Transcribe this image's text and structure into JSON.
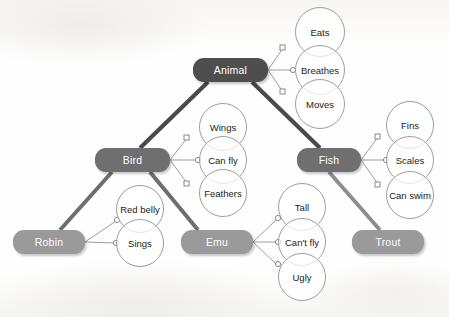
{
  "diagram": {
    "colors": {
      "tier1": "#4e4e4e",
      "tier2": "#6f6f6f",
      "tier3": "#9a9a9a",
      "thick_edge_dark": "#4a4a4a",
      "thick_edge_mid": "#6e6e6e",
      "thick_edge_light": "#8d8d8d",
      "thin_edge": "#9d9d9d",
      "circle_stroke": "#9d9d9d",
      "node_text": "#ffffff",
      "circle_text": "#1b1b1b",
      "background": "#fdfdfc"
    },
    "nodes": [
      {
        "id": "animal",
        "label": "Animal",
        "tier": 1,
        "x": 193,
        "y": 58,
        "w": 75,
        "h": 24
      },
      {
        "id": "bird",
        "label": "Bird",
        "tier": 2,
        "x": 95,
        "y": 148,
        "w": 75,
        "h": 24
      },
      {
        "id": "fish",
        "label": "Fish",
        "tier": 2,
        "x": 297,
        "y": 148,
        "w": 64,
        "h": 24
      },
      {
        "id": "robin",
        "label": "Robin",
        "tier": 3,
        "x": 13,
        "y": 230,
        "w": 72,
        "h": 24
      },
      {
        "id": "emu",
        "label": "Emu",
        "tier": 3,
        "x": 181,
        "y": 230,
        "w": 72,
        "h": 24
      },
      {
        "id": "trout",
        "label": "Trout",
        "tier": 3,
        "x": 352,
        "y": 230,
        "w": 72,
        "h": 24
      }
    ],
    "attributes": [
      {
        "id": "eats",
        "label": "Eats",
        "owner": "animal",
        "cx": 320,
        "cy": 32,
        "r": 25
      },
      {
        "id": "breathes",
        "label": "Breathes",
        "owner": "animal",
        "cx": 320,
        "cy": 70,
        "r": 25
      },
      {
        "id": "moves",
        "label": "Moves",
        "owner": "animal",
        "cx": 320,
        "cy": 104,
        "r": 25
      },
      {
        "id": "wings",
        "label": "Wings",
        "owner": "bird",
        "cx": 223,
        "cy": 127,
        "r": 24
      },
      {
        "id": "can-fly",
        "label": "Can fly",
        "owner": "bird",
        "cx": 223,
        "cy": 160,
        "r": 24
      },
      {
        "id": "feathers",
        "label": "Feathers",
        "owner": "bird",
        "cx": 223,
        "cy": 193,
        "r": 24
      },
      {
        "id": "fins",
        "label": "Fins",
        "owner": "fish",
        "cx": 410,
        "cy": 125,
        "r": 24
      },
      {
        "id": "scales",
        "label": "Scales",
        "owner": "fish",
        "cx": 410,
        "cy": 160,
        "r": 24
      },
      {
        "id": "can-swim",
        "label": "Can swim",
        "owner": "fish",
        "cx": 410,
        "cy": 195,
        "r": 24
      },
      {
        "id": "red-belly",
        "label": "Red belly",
        "owner": "robin",
        "cx": 140,
        "cy": 209,
        "r": 24
      },
      {
        "id": "sings",
        "label": "Sings",
        "owner": "robin",
        "cx": 140,
        "cy": 243,
        "r": 24
      },
      {
        "id": "tall",
        "label": "Tall",
        "owner": "emu",
        "cx": 302,
        "cy": 207,
        "r": 24
      },
      {
        "id": "cant-fly",
        "label": "Can't fly",
        "owner": "emu",
        "cx": 302,
        "cy": 242,
        "r": 24
      },
      {
        "id": "ugly",
        "label": "Ugly",
        "owner": "emu",
        "cx": 302,
        "cy": 277,
        "r": 24
      }
    ],
    "hierarchy_edges": [
      {
        "from": "animal",
        "to": "bird",
        "style": "thick-dark"
      },
      {
        "from": "animal",
        "to": "fish",
        "style": "thick-dark"
      },
      {
        "from": "bird",
        "to": "robin",
        "style": "thick-mid"
      },
      {
        "from": "bird",
        "to": "emu",
        "style": "thick-mid"
      },
      {
        "from": "fish",
        "to": "trout",
        "style": "thick-light"
      }
    ]
  }
}
